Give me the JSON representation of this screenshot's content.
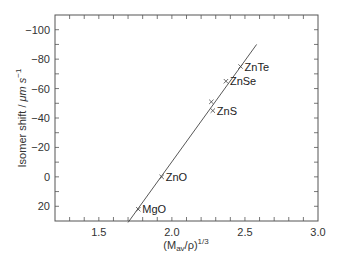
{
  "chart_data": {
    "type": "scatter",
    "title": "",
    "xlabel": "(M_av/ρ)^1/3",
    "xlabel_parts": {
      "base": "(M",
      "sub": "av",
      "mid": "/ρ)",
      "sup": "1/3"
    },
    "ylabel": "Isomer shift / μm s⁻¹",
    "ylabel_parts": {
      "main": "Isomer shift / ",
      "unit": "μm s",
      "sup": "−1"
    },
    "xlim": [
      1.2,
      3.0
    ],
    "ylim": [
      30,
      -110
    ],
    "y_inverted": true,
    "grid": false,
    "legend": "none",
    "x_ticks": [
      1.5,
      2.0,
      2.5,
      3.0
    ],
    "x_tick_labels": [
      "1.5",
      "2.0",
      "2.5",
      "3.0"
    ],
    "x_minor_step": 0.1,
    "y_ticks": [
      -100,
      -80,
      -60,
      -40,
      -20,
      0,
      20
    ],
    "y_tick_labels": [
      "−100",
      "−80",
      "−60",
      "−40",
      "−20",
      "0",
      "20"
    ],
    "y_minor_step": 10,
    "series": [
      {
        "name": "compounds",
        "marker": "x",
        "points": [
          {
            "label": "MgO",
            "x": 1.77,
            "y": 22
          },
          {
            "label": "ZnO",
            "x": 1.93,
            "y": 0
          },
          {
            "label": "",
            "x": 2.27,
            "y": -51
          },
          {
            "label": "ZnS",
            "x": 2.28,
            "y": -45
          },
          {
            "label": "ZnSe",
            "x": 2.37,
            "y": -65
          },
          {
            "label": "ZnTe",
            "x": 2.47,
            "y": -75
          }
        ]
      }
    ],
    "fit_line": {
      "x1": 1.7,
      "y1": 31,
      "x2": 2.58,
      "y2": -90
    }
  }
}
